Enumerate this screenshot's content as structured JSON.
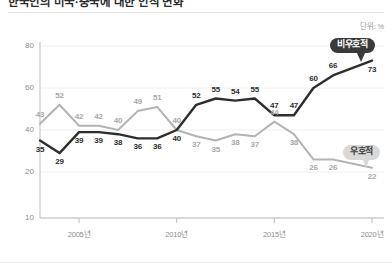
{
  "header": {
    "title": "한국인의 미국·중국에 대한 인식 변화",
    "unit_label": "단위: %",
    "rule_color": "#e2e2e2"
  },
  "legend": {
    "unfavorable": {
      "label": "비우호적",
      "color": "#2e2e2e"
    },
    "favorable": {
      "label": "우호적",
      "color": "#b4b4b4"
    }
  },
  "chart_data": {
    "type": "line",
    "title": "한국인의 미국·중국에 대한 인식 변화",
    "xlabel": "",
    "ylabel": "",
    "unit": "%",
    "grid": true,
    "legend_position": "inline-right",
    "ylim": [
      10,
      85
    ],
    "yticks": [
      10,
      20,
      40,
      60,
      80
    ],
    "ytick_labels": [
      "10",
      "20",
      "40",
      "60",
      "80"
    ],
    "xlim": [
      2003,
      2020
    ],
    "xticks": [
      2005,
      2010,
      2015,
      2020
    ],
    "xtick_labels": [
      "2005년",
      "2010년",
      "2015년",
      "2020년"
    ],
    "x": [
      2003,
      2004,
      2005,
      2006,
      2007,
      2008,
      2009,
      2010,
      2011,
      2012,
      2013,
      2014,
      2015,
      2016,
      2017,
      2018,
      2019,
      2020
    ],
    "series": [
      {
        "name": "비우호적",
        "color": "#2e2e2e",
        "label_color": "#2e2e2e",
        "values": [
          35,
          29,
          39,
          39,
          38,
          36,
          36,
          40,
          52,
          55,
          54,
          55,
          47,
          47,
          60,
          66,
          73
        ],
        "x": [
          2003,
          2004,
          2005,
          2006,
          2007,
          2008,
          2009,
          2010,
          2011,
          2012,
          2013,
          2014,
          2015,
          2016,
          2017,
          2018,
          2020
        ],
        "label_side": [
          "below",
          "below",
          "below",
          "below",
          "below",
          "below",
          "below",
          "below",
          "above",
          "above",
          "above",
          "above",
          "above",
          "above",
          "above",
          "above",
          "below"
        ]
      },
      {
        "name": "우호적",
        "color": "#b4b4b4",
        "label_color": "#a8a8a8",
        "values": [
          43,
          52,
          42,
          42,
          40,
          49,
          51,
          40,
          37,
          35,
          38,
          37,
          44,
          38,
          26,
          26,
          22
        ],
        "x": [
          2003,
          2004,
          2005,
          2006,
          2007,
          2008,
          2009,
          2010,
          2011,
          2012,
          2013,
          2014,
          2015,
          2016,
          2017,
          2018,
          2020
        ],
        "label_side": [
          "above",
          "above",
          "above",
          "above",
          "above",
          "above",
          "above",
          "above",
          "below",
          "below",
          "below",
          "below",
          "above",
          "below",
          "below",
          "below",
          "below"
        ]
      }
    ]
  }
}
